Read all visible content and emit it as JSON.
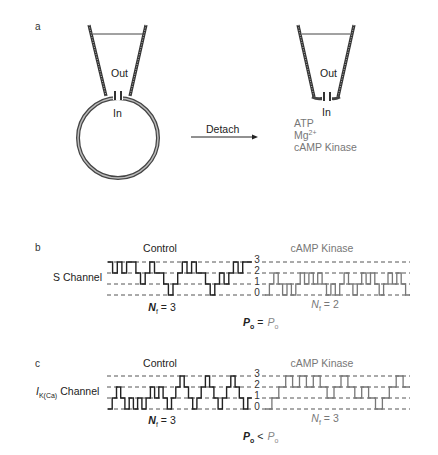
{
  "panel_a": {
    "label": "a",
    "left_pipette": {
      "out_label": "Out",
      "in_label": "In"
    },
    "arrow_label": "Detach",
    "right_pipette": {
      "out_label": "Out",
      "in_label": "In"
    },
    "additions": [
      "ATP",
      "Mg",
      "cAMP Kinase"
    ],
    "mg_superscript": "2+"
  },
  "panel_b": {
    "label": "b",
    "channel_label": "S Channel",
    "control_title": "Control",
    "kinase_title": "cAMP Kinase",
    "levels": [
      "3",
      "2",
      "1",
      "0"
    ],
    "control_nf_label": "N",
    "control_nf_sub": "f",
    "control_nf_value": "= 3",
    "kinase_nf_label": "N",
    "kinase_nf_sub": "f",
    "kinase_nf_value": "= 2",
    "po_left": "P",
    "po_left_sub": "o",
    "po_relation": "=",
    "po_right": "P",
    "po_right_sub": "o",
    "control_trace_levels": [
      3,
      2,
      3,
      2,
      3,
      3,
      2,
      1,
      2,
      3,
      2,
      2,
      1,
      0,
      1,
      2,
      3,
      2,
      3,
      2,
      2,
      1,
      0,
      1,
      2,
      1,
      2,
      3,
      2,
      3,
      3
    ],
    "kinase_trace_levels": [
      0,
      1,
      2,
      1,
      0,
      1,
      0,
      1,
      2,
      1,
      2,
      1,
      2,
      1,
      0,
      1,
      0,
      1,
      2,
      1,
      0,
      1,
      2,
      1,
      2,
      1,
      0,
      1,
      2,
      1,
      2,
      1,
      0
    ]
  },
  "panel_c": {
    "label": "c",
    "channel_label_main": "I",
    "channel_label_sub": "K(Ca)",
    "channel_label_suffix": "Channel",
    "control_title": "Control",
    "kinase_title": "cAMP Kinase",
    "levels": [
      "3",
      "2",
      "1",
      "0"
    ],
    "control_nf_label": "N",
    "control_nf_sub": "f",
    "control_nf_value": "= 3",
    "kinase_nf_label": "N",
    "kinase_nf_sub": "f",
    "kinase_nf_value": "= 3",
    "po_left": "P",
    "po_left_sub": "o",
    "po_relation": "<",
    "po_right": "P",
    "po_right_sub": "o",
    "control_trace_levels": [
      0,
      1,
      2,
      1,
      0,
      1,
      0,
      1,
      0,
      1,
      2,
      1,
      2,
      1,
      0,
      1,
      2,
      3,
      2,
      1,
      0,
      1,
      2,
      3,
      2,
      1,
      0,
      1,
      2,
      3,
      2,
      1,
      0,
      1
    ],
    "kinase_trace_levels": [
      0,
      1,
      2,
      3,
      2,
      3,
      2,
      3,
      2,
      1,
      2,
      3,
      2,
      1,
      2,
      1,
      0,
      1,
      2,
      3,
      2
    ]
  }
}
